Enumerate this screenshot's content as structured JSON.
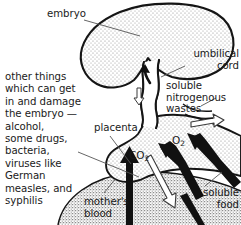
{
  "figure": {
    "width": 241,
    "height": 225,
    "background": "#ffffff",
    "ink": "#111111"
  },
  "labels": {
    "embryo": "embryo",
    "umbilical_cord": "umbilical\ncord",
    "soluble_nitrogenous_wastes": "soluble\nnitrogenous\nwastes",
    "other_things": "other things\nwhich can get\nin and damage\nthe embryo —\nalcohol,\nsome drugs,\nbacteria,\nviruses like\nGerman\nmeasles, and\nsyphilis",
    "placenta": "placenta",
    "carbon_dioxide": "CO",
    "carbon_dioxide_sub": "2",
    "oxygen": "O",
    "oxygen_sub": "2",
    "mothers_blood": "mother's\nblood",
    "soluble_food": "soluble\nfood"
  },
  "structures": [
    {
      "name": "embryo",
      "fill": "stipple-light",
      "description": "large kidney-shaped stippled body at top"
    },
    {
      "name": "umbilical-cord",
      "fill": "white",
      "description": "wavy vertical band linking embryo to placenta"
    },
    {
      "name": "placenta",
      "fill": "stipple-light",
      "description": "lumpy mass at base of cord"
    },
    {
      "name": "mothers-blood",
      "fill": "stipple-dense",
      "description": "dense stippled region below arc"
    }
  ],
  "flows": [
    {
      "name": "oxygen-in",
      "label": "O2",
      "style": "solid-black-arrow",
      "direction": "up-left",
      "meaning": "oxygen passes to embryo"
    },
    {
      "name": "soluble-food-in",
      "label": "soluble food",
      "style": "solid-black-arrow",
      "direction": "up-left",
      "meaning": "soluble food passes to embryo"
    },
    {
      "name": "carbon-dioxide-out",
      "label": "CO2",
      "style": "outline-white-arrow",
      "direction": "down-right",
      "meaning": "carbon dioxide leaves embryo"
    },
    {
      "name": "wastes-out",
      "label": "soluble nitrogenous wastes",
      "style": "outline-white-arrow",
      "direction": "right",
      "meaning": "nitrogenous wastes leave embryo"
    },
    {
      "name": "harmful-substances-in",
      "label": "other things",
      "style": "solid-black-arrow",
      "direction": "up",
      "meaning": "harmful substances cross placenta"
    }
  ],
  "colors": {
    "ink": "#111111",
    "stipple_light": "#d8d8d8",
    "stipple_dense": "#b8b8b8",
    "white": "#ffffff"
  }
}
